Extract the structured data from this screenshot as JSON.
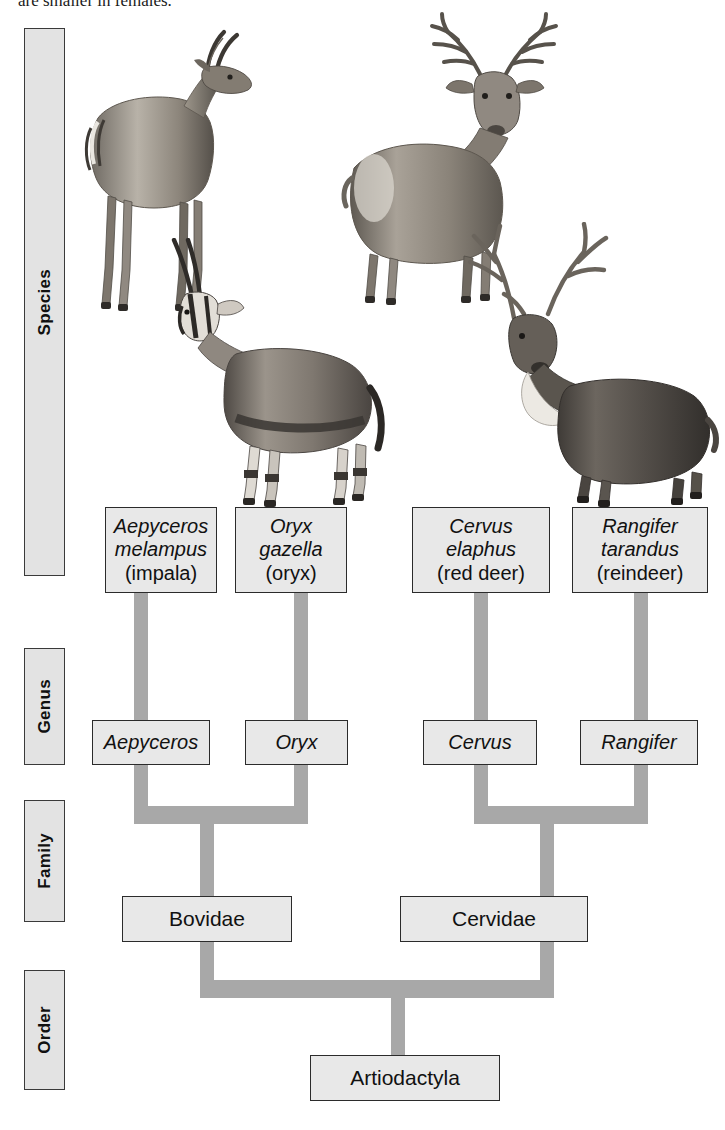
{
  "figure": {
    "top_caption": "are smaller in females.",
    "background_color": "#ffffff",
    "node_fill": "#e8e8e8",
    "node_border": "#2b2b2b",
    "connector_color": "#a8a8a8",
    "rank_bar_fill": "#e3e3e3"
  },
  "ranks": [
    {
      "label": "Species"
    },
    {
      "label": "Genus"
    },
    {
      "label": "Family"
    },
    {
      "label": "Order"
    }
  ],
  "species": [
    {
      "genus_name": "Aepyceros",
      "epithet": "melampus",
      "common": "(impala)"
    },
    {
      "genus_name": "Oryx",
      "epithet": "gazella",
      "common": "(oryx)"
    },
    {
      "genus_name": "Cervus",
      "epithet": "elaphus",
      "common": "(red deer)"
    },
    {
      "genus_name": "Rangifer",
      "epithet": "tarandus",
      "common": "(reindeer)"
    }
  ],
  "genera": [
    {
      "label": "Aepyceros"
    },
    {
      "label": "Oryx"
    },
    {
      "label": "Cervus"
    },
    {
      "label": "Rangifer"
    }
  ],
  "families": [
    {
      "label": "Bovidae"
    },
    {
      "label": "Cervidae"
    }
  ],
  "order": {
    "label": "Artiodactyla"
  },
  "illustrations": [
    {
      "name": "impala",
      "caption": "impala standing, lyre-shaped horns"
    },
    {
      "name": "red-deer",
      "caption": "red deer stag with branched antlers"
    },
    {
      "name": "oryx",
      "caption": "oryx with long straight horns"
    },
    {
      "name": "reindeer",
      "caption": "reindeer with palmate antlers"
    }
  ]
}
